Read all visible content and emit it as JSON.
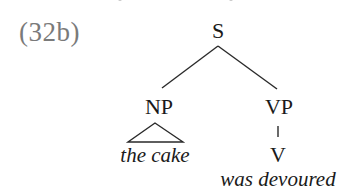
{
  "example": {
    "label": "(32b)"
  },
  "tree": {
    "root": {
      "label": "S",
      "children": [
        {
          "label": "NP",
          "children_collapsed": true,
          "leaf": "the cake"
        },
        {
          "label": "VP",
          "children": [
            {
              "label": "V",
              "leaf": "was devoured"
            }
          ]
        }
      ]
    }
  },
  "nodes": {
    "s": "S",
    "np": "NP",
    "vp": "VP",
    "v": "V"
  },
  "leaves": {
    "np_leaf": "the cake",
    "v_leaf": "was devoured"
  },
  "colors": {
    "label_gray": "#7a7a7a",
    "text": "#1a1a1a",
    "edge": "#2a2a2a"
  }
}
